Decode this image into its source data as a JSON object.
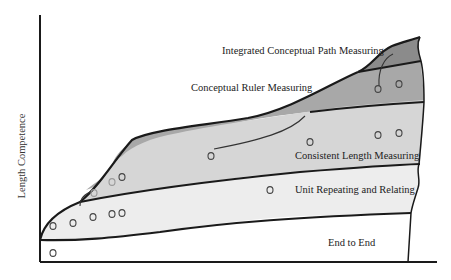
{
  "diagram": {
    "y_axis_label": "Length Competence",
    "levels": [
      {
        "name": "End to End",
        "fill": "#ffffff"
      },
      {
        "name": "Unit Repeating and Relating",
        "fill": "#ededed"
      },
      {
        "name": "Consistent Length Measuring",
        "fill": "#d6d6d6"
      },
      {
        "name": "Conceptual Ruler Measuring",
        "fill": "#a8a8a8"
      },
      {
        "name": "Integrated Conceptual Path Measuring",
        "fill": "#8b8b8b"
      }
    ],
    "data_points": [
      {
        "x": 53,
        "y": 253,
        "level": "End to End"
      },
      {
        "x": 53,
        "y": 226,
        "level": "Unit Repeating and Relating"
      },
      {
        "x": 73,
        "y": 223,
        "level": "Unit Repeating and Relating"
      },
      {
        "x": 93,
        "y": 217,
        "level": "Unit Repeating and Relating"
      },
      {
        "x": 112,
        "y": 214,
        "level": "Unit Repeating and Relating"
      },
      {
        "x": 122,
        "y": 213,
        "level": "Unit Repeating and Relating"
      },
      {
        "x": 270,
        "y": 190,
        "level": "Unit Repeating and Relating"
      },
      {
        "x": 94,
        "y": 193,
        "level": "Consistent Length Measuring",
        "faint": true
      },
      {
        "x": 112,
        "y": 182,
        "level": "Consistent Length Measuring",
        "faint": true
      },
      {
        "x": 122,
        "y": 177,
        "level": "Consistent Length Measuring"
      },
      {
        "x": 211,
        "y": 156,
        "level": "Consistent Length Measuring"
      },
      {
        "x": 310,
        "y": 142,
        "level": "Consistent Length Measuring"
      },
      {
        "x": 378,
        "y": 135,
        "level": "Consistent Length Measuring"
      },
      {
        "x": 399,
        "y": 133,
        "level": "Consistent Length Measuring"
      },
      {
        "x": 378,
        "y": 89,
        "level": "Conceptual Ruler Measuring"
      },
      {
        "x": 399,
        "y": 84,
        "level": "Conceptual Ruler Measuring"
      }
    ]
  }
}
